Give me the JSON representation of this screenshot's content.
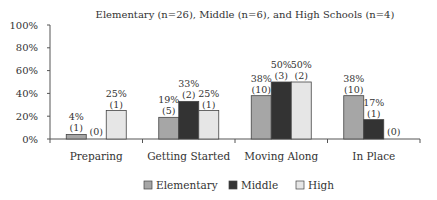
{
  "chart_data": {
    "type": "bar",
    "title": "Elementary (n=26), Middle (n=6), and High Schools (n=4)",
    "xlabel": "",
    "ylabel": "",
    "ylim": [
      0,
      100
    ],
    "yticks": [
      "0%",
      "20%",
      "40%",
      "60%",
      "80%",
      "100%"
    ],
    "ytick_values": [
      0,
      20,
      40,
      60,
      80,
      100
    ],
    "grid": false,
    "legend_position": "bottom-center",
    "categories": [
      "Preparing",
      "Getting Started",
      "Moving Along",
      "In Place"
    ],
    "series": [
      {
        "name": "Elementary",
        "color": "#a6a6a6",
        "values": [
          4,
          19,
          38,
          38
        ],
        "labels_pct": [
          "4%",
          "19%",
          "38%",
          "38%"
        ],
        "labels_n": [
          "(1)",
          "(5)",
          "(10)",
          "(10)"
        ]
      },
      {
        "name": "Middle",
        "color": "#333333",
        "values": [
          0,
          33,
          50,
          17
        ],
        "labels_pct": [
          "",
          "33%",
          "50%",
          "17%"
        ],
        "labels_n": [
          "(0)",
          "(2)",
          "(3)",
          "(1)"
        ]
      },
      {
        "name": "High",
        "color": "#e6e6e6",
        "values": [
          25,
          25,
          50,
          0
        ],
        "labels_pct": [
          "25%",
          "25%",
          "50%",
          ""
        ],
        "labels_n": [
          "(1)",
          "(1)",
          "(2)",
          "(0)"
        ]
      }
    ]
  }
}
